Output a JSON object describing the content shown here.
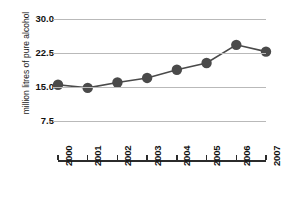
{
  "chart_data": {
    "type": "line",
    "title": "",
    "xlabel": "",
    "ylabel": "million litres of pure alcohol",
    "categories": [
      "2000",
      "2001",
      "2002",
      "2003",
      "2004",
      "2005",
      "2006",
      "2007"
    ],
    "values": [
      15.5,
      14.8,
      16.0,
      17.0,
      18.8,
      20.3,
      24.3,
      22.8
    ],
    "series": [
      {
        "name": "pure alcohol",
        "values": [
          15.5,
          14.8,
          16.0,
          17.0,
          18.8,
          20.3,
          24.3,
          22.8
        ]
      }
    ],
    "ylim": [
      0,
      30
    ],
    "yticks": [
      7.5,
      15.0,
      22.5,
      30.0
    ],
    "ytick_labels": [
      "7.5",
      "15.0",
      "22.5",
      "30.0"
    ],
    "xtick_labels": [
      "2000",
      "2001",
      "2002",
      "2003",
      "2004",
      "2005",
      "2006",
      "2007"
    ],
    "grid": true,
    "legend": false,
    "legend_position": "none",
    "marker": "circle",
    "colors": {
      "marker": "#4a4a4a",
      "line": "#4a4a4a",
      "gridline": "#b9b9b9",
      "axis": "#2b2b2b",
      "text": "#111111",
      "background": "#ffffff"
    }
  }
}
